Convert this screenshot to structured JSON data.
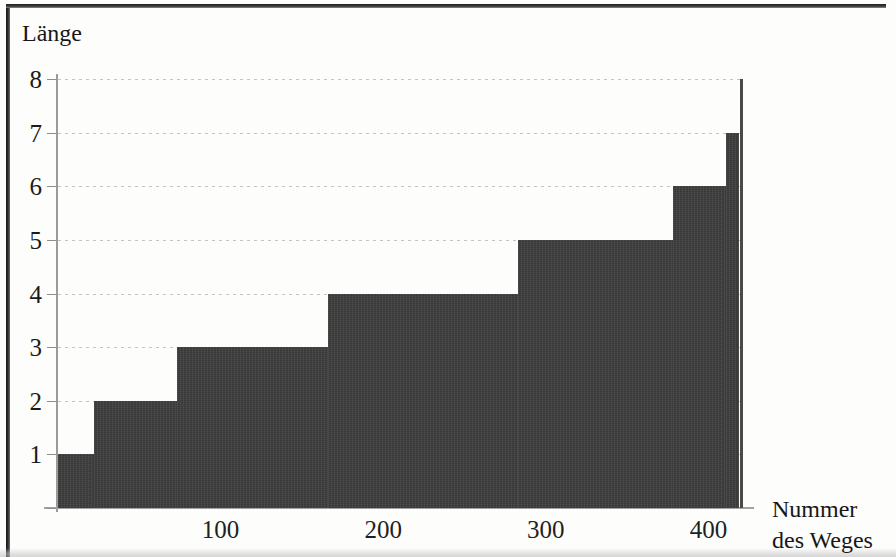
{
  "chart_data": {
    "type": "area",
    "title": "",
    "subtitle": "",
    "ylabel": "Länge",
    "xlabel": "Nummer des Weges",
    "xlabel_line1": "Nummer",
    "xlabel_line2": "des Weges",
    "style": "step",
    "grid": true,
    "legend": null,
    "xlim": [
      0,
      420
    ],
    "ylim": [
      0,
      8
    ],
    "yticks": [
      1,
      2,
      3,
      4,
      5,
      6,
      7,
      8
    ],
    "ytick_labels": [
      "1",
      "2",
      "3",
      "4",
      "5",
      "6",
      "7",
      "8"
    ],
    "xticks": [
      100,
      200,
      300,
      400
    ],
    "xtick_labels": [
      "100",
      "200",
      "300",
      "400"
    ],
    "fill_color": "#3e3e3e",
    "grid_color": "#969696",
    "axis_color": "#9a9a9a",
    "text_color": "#1b1b1b",
    "steps": [
      {
        "x_start": 0,
        "x_end": 22,
        "value": 1
      },
      {
        "x_start": 22,
        "x_end": 73,
        "value": 2
      },
      {
        "x_start": 73,
        "x_end": 166,
        "value": 3
      },
      {
        "x_start": 166,
        "x_end": 283,
        "value": 4
      },
      {
        "x_start": 283,
        "x_end": 378,
        "value": 5
      },
      {
        "x_start": 378,
        "x_end": 411,
        "value": 6
      },
      {
        "x_start": 411,
        "x_end": 419,
        "value": 7
      },
      {
        "x_start": 419,
        "x_end": 420,
        "value": 8
      }
    ],
    "x": [
      0,
      22,
      73,
      166,
      283,
      378,
      411,
      419,
      420
    ],
    "y": [
      1,
      2,
      3,
      4,
      5,
      6,
      7,
      8,
      8
    ]
  }
}
